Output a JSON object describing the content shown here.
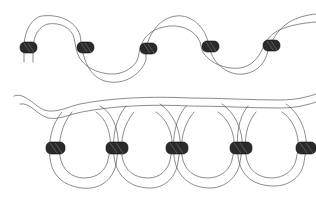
{
  "illustration": {
    "description": "Hand-drawn sketch of two cord strands threaded with dark beads",
    "background": "#ffffff",
    "line_color": "#5a5a5a",
    "bead_color": "#2a2a2a",
    "strands": [
      {
        "name": "top-wave-strand",
        "shape": "sine wave",
        "beads": [
          {
            "x": 28,
            "y": 47
          },
          {
            "x": 85,
            "y": 47
          },
          {
            "x": 148,
            "y": 48
          },
          {
            "x": 211,
            "y": 46
          },
          {
            "x": 272,
            "y": 45
          }
        ]
      },
      {
        "name": "bottom-looped-strand",
        "shape": "overlapping loops",
        "beads": [
          {
            "x": 54,
            "y": 148
          },
          {
            "x": 116,
            "y": 148
          },
          {
            "x": 176,
            "y": 148
          },
          {
            "x": 240,
            "y": 148
          },
          {
            "x": 305,
            "y": 148
          }
        ]
      }
    ]
  }
}
